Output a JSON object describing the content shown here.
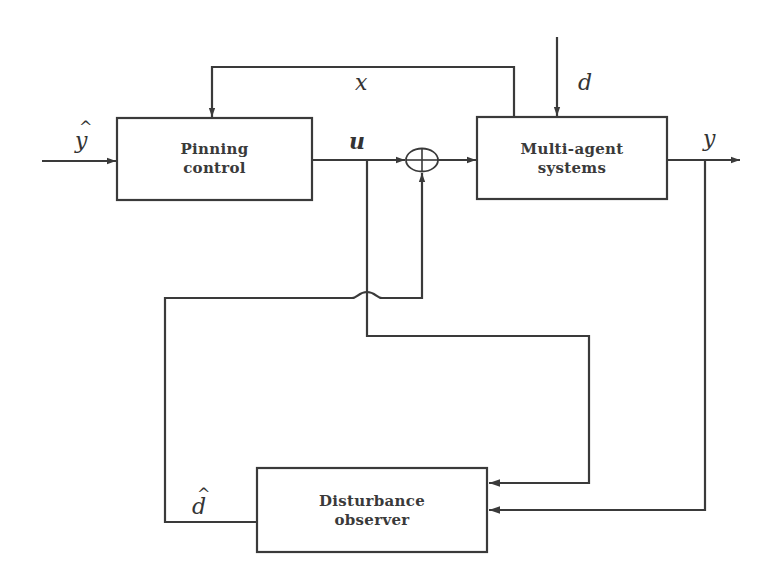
{
  "diagram": {
    "type": "block-diagram",
    "colors": {
      "line": "#3a3a3a",
      "text": "#333333",
      "background": "#ffffff"
    },
    "blocks": [
      {
        "id": "pinning-control",
        "line1": "Pinning",
        "line2": "control"
      },
      {
        "id": "multi-agent-systems",
        "line1": "Multi-agent",
        "line2": "systems"
      },
      {
        "id": "disturbance-observer",
        "line1": "Disturbance",
        "line2": "observer"
      }
    ],
    "signals": {
      "y_hat": "y",
      "y_hat_accent": "^",
      "x": "x",
      "d": "d",
      "u": "u",
      "y": "y",
      "d_hat": "d",
      "d_hat_accent": "^"
    },
    "summing_junction": {
      "symbol": "⊕"
    },
    "connections": [
      {
        "from": "input y_hat",
        "to": "pinning-control"
      },
      {
        "from": "multi-agent-systems",
        "to": "pinning-control",
        "label": "x"
      },
      {
        "from": "external d",
        "to": "multi-agent-systems",
        "label": "d"
      },
      {
        "from": "pinning-control",
        "to": "summing-junction",
        "label": "u"
      },
      {
        "from": "summing-junction",
        "to": "multi-agent-systems"
      },
      {
        "from": "multi-agent-systems",
        "to": "output",
        "label": "y"
      },
      {
        "from": "u branch",
        "to": "disturbance-observer"
      },
      {
        "from": "y branch",
        "to": "disturbance-observer"
      },
      {
        "from": "disturbance-observer",
        "to": "summing-junction",
        "label": "d_hat"
      }
    ]
  }
}
